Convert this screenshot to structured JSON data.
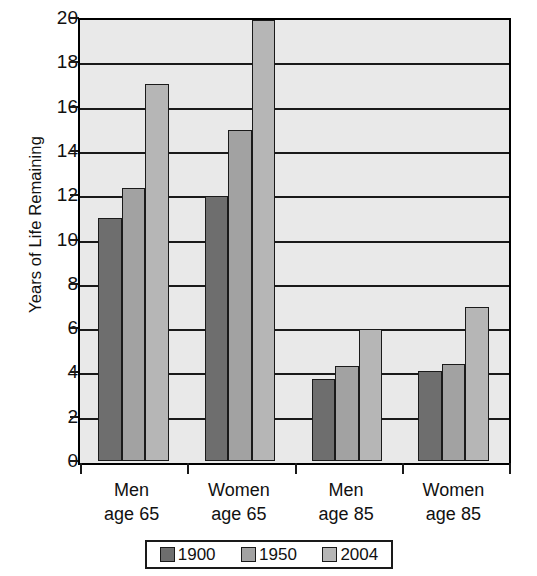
{
  "chart_data": {
    "type": "bar",
    "title": "",
    "xlabel": "",
    "ylabel": "Years of Life Remaining",
    "ylim": [
      0,
      20
    ],
    "ytick_step": 2,
    "yticks": [
      "20",
      "18",
      "16",
      "14",
      "12",
      "10",
      "8",
      "6",
      "4",
      "2",
      "0"
    ],
    "grid": true,
    "legend_position": "bottom",
    "categories": [
      {
        "line1": "Men",
        "line2": "age 65"
      },
      {
        "line1": "Women",
        "line2": "age 65"
      },
      {
        "line1": "Men",
        "line2": "age 85"
      },
      {
        "line1": "Women",
        "line2": "age 85"
      }
    ],
    "category_labels": [
      "Men age 65",
      "Women age 65",
      "Men age 85",
      "Women age 85"
    ],
    "series": [
      {
        "name": "1900",
        "color": "#6e6e6e",
        "values": [
          11.0,
          12.0,
          3.7,
          4.1
        ]
      },
      {
        "name": "1950",
        "color": "#a2a2a2",
        "values": [
          12.4,
          15.0,
          4.3,
          4.4
        ]
      },
      {
        "name": "2004",
        "color": "#b6b6b6",
        "values": [
          17.1,
          20.0,
          6.0,
          7.0
        ]
      }
    ]
  },
  "colors": {
    "plot_background": "#e9e9e9",
    "axis": "#1a1a1a",
    "text": "#111111",
    "series_1900": "#6e6e6e",
    "series_1950": "#a2a2a2",
    "series_2004": "#b6b6b6"
  }
}
